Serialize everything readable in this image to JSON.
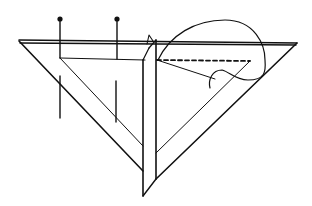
{
  "diagram": {
    "stroke_color": "#111111",
    "background": "#ffffff",
    "elements": {
      "top_bar": {
        "x1": 19,
        "x2": 297,
        "y": 42
      },
      "bottom_tip": {
        "x": 143,
        "y": 196
      },
      "pins": [
        {
          "x": 60,
          "head_y": 19
        },
        {
          "x": 117,
          "head_y": 19
        }
      ],
      "dashed_line": {
        "x1": 157,
        "y1": 60,
        "x2": 250,
        "y2": 61
      }
    }
  }
}
